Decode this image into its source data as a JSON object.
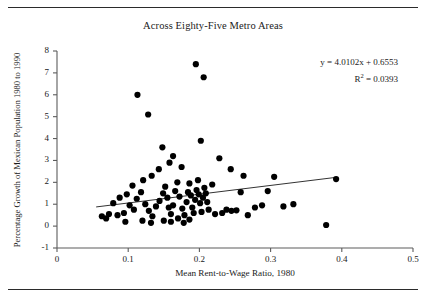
{
  "figure": {
    "title": "Across Eighty-Five Metro Areas",
    "has_top_rule": true,
    "has_bottom_rule": true
  },
  "annotation": {
    "equation": "y = 4.0102x + 0.6553",
    "r_squared_prefix": "R",
    "r_squared_exp": "2",
    "r_squared_value": " = 0.0393"
  },
  "chart_data": {
    "type": "scatter",
    "title": "Across Eighty-Five Metro Areas",
    "xlabel": "Mean Rent-to-Wage Ratio, 1980",
    "ylabel": "Percentage Growth of Mexican Population 1980 to 1990",
    "xlim": [
      0,
      0.5
    ],
    "ylim": [
      -1,
      8
    ],
    "xticks": [
      0,
      0.1,
      0.2,
      0.3,
      0.4,
      0.5
    ],
    "xtick_labels": [
      "0",
      "0.1",
      "0.2",
      "0.3",
      "0.4",
      "0.5"
    ],
    "yticks": [
      -1,
      0,
      1,
      2,
      3,
      4,
      5,
      6,
      7,
      8
    ],
    "ytick_labels": [
      "-1",
      "0",
      "1",
      "2",
      "3",
      "4",
      "5",
      "6",
      "7",
      "8"
    ],
    "grid": false,
    "legend": false,
    "marker": "filled-circle",
    "marker_color": "#000000",
    "n_points": 85,
    "trendline": {
      "equation": "y = 4.0102x + 0.6553",
      "slope": 4.0102,
      "intercept": 0.6553,
      "r_squared": 0.0393,
      "x_start": 0.055,
      "x_end": 0.392,
      "color": "#333333"
    },
    "points": [
      [
        0.113,
        6.0
      ],
      [
        0.128,
        5.1
      ],
      [
        0.148,
        3.6
      ],
      [
        0.195,
        7.4
      ],
      [
        0.206,
        6.8
      ],
      [
        0.163,
        3.2
      ],
      [
        0.158,
        2.9
      ],
      [
        0.175,
        2.7
      ],
      [
        0.202,
        3.9
      ],
      [
        0.228,
        3.1
      ],
      [
        0.244,
        2.6
      ],
      [
        0.262,
        2.3
      ],
      [
        0.143,
        2.6
      ],
      [
        0.133,
        2.3
      ],
      [
        0.121,
        2.1
      ],
      [
        0.106,
        1.85
      ],
      [
        0.098,
        1.45
      ],
      [
        0.088,
        1.3
      ],
      [
        0.079,
        1.05
      ],
      [
        0.073,
        0.55
      ],
      [
        0.063,
        0.45
      ],
      [
        0.069,
        0.35
      ],
      [
        0.085,
        0.5
      ],
      [
        0.094,
        0.6
      ],
      [
        0.102,
        0.95
      ],
      [
        0.108,
        0.75
      ],
      [
        0.112,
        1.25
      ],
      [
        0.118,
        1.55
      ],
      [
        0.124,
        1.0
      ],
      [
        0.129,
        0.7
      ],
      [
        0.134,
        0.45
      ],
      [
        0.139,
        0.9
      ],
      [
        0.144,
        1.15
      ],
      [
        0.149,
        1.5
      ],
      [
        0.152,
        1.8
      ],
      [
        0.155,
        1.3
      ],
      [
        0.157,
        0.85
      ],
      [
        0.16,
        0.55
      ],
      [
        0.163,
        0.95
      ],
      [
        0.166,
        1.6
      ],
      [
        0.169,
        2.0
      ],
      [
        0.172,
        1.35
      ],
      [
        0.176,
        0.8
      ],
      [
        0.179,
        0.5
      ],
      [
        0.182,
        1.1
      ],
      [
        0.184,
        1.55
      ],
      [
        0.186,
        1.95
      ],
      [
        0.188,
        1.4
      ],
      [
        0.19,
        0.85
      ],
      [
        0.192,
        0.6
      ],
      [
        0.194,
        1.2
      ],
      [
        0.196,
        1.65
      ],
      [
        0.198,
        2.1
      ],
      [
        0.199,
        1.45
      ],
      [
        0.201,
        1.05
      ],
      [
        0.203,
        0.65
      ],
      [
        0.205,
        1.3
      ],
      [
        0.207,
        1.75
      ],
      [
        0.209,
        1.5
      ],
      [
        0.211,
        1.1
      ],
      [
        0.213,
        0.75
      ],
      [
        0.15,
        0.25
      ],
      [
        0.16,
        0.2
      ],
      [
        0.17,
        0.35
      ],
      [
        0.178,
        0.15
      ],
      [
        0.186,
        0.3
      ],
      [
        0.12,
        0.25
      ],
      [
        0.132,
        0.15
      ],
      [
        0.096,
        0.2
      ],
      [
        0.218,
        1.9
      ],
      [
        0.222,
        0.55
      ],
      [
        0.232,
        0.6
      ],
      [
        0.238,
        0.75
      ],
      [
        0.245,
        0.7
      ],
      [
        0.252,
        0.72
      ],
      [
        0.258,
        1.55
      ],
      [
        0.268,
        0.5
      ],
      [
        0.278,
        0.85
      ],
      [
        0.288,
        0.95
      ],
      [
        0.296,
        1.6
      ],
      [
        0.305,
        2.25
      ],
      [
        0.318,
        0.9
      ],
      [
        0.332,
        1.0
      ],
      [
        0.378,
        0.05
      ],
      [
        0.392,
        2.15
      ]
    ]
  }
}
